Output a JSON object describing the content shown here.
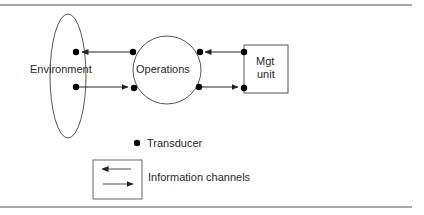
{
  "diagram": {
    "nodes": {
      "environment": {
        "label": "Environment",
        "shape": "ellipse"
      },
      "operations": {
        "label": "Operations",
        "shape": "circle"
      },
      "mgt_unit": {
        "label_line1": "Mgt",
        "label_line2": "unit",
        "shape": "rectangle"
      }
    },
    "edges": [
      {
        "from": "operations",
        "to": "environment",
        "direction": "left"
      },
      {
        "from": "environment",
        "to": "operations",
        "direction": "right"
      },
      {
        "from": "mgt_unit",
        "to": "operations",
        "direction": "left"
      },
      {
        "from": "operations",
        "to": "mgt_unit",
        "direction": "right"
      }
    ],
    "legend": {
      "transducer_label": "Transducer",
      "channels_label": "Information channels"
    },
    "colors": {
      "stroke": "#333333",
      "dot": "#000000",
      "rule": "#555555"
    }
  }
}
